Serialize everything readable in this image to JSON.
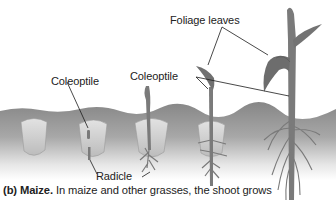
{
  "figure": {
    "labels": {
      "foliage_leaves": "Foliage leaves",
      "coleoptile_left": "Coleoptile",
      "coleoptile_right": "Coleoptile",
      "radicle": "Radicle"
    },
    "caption": {
      "prefix": "(b) Maize.",
      "text": " In maize and other grasses, the shoot grows"
    },
    "colors": {
      "soil_top": "#8a8a8a",
      "soil_bottom": "#ffffff",
      "seed": "#d6d6d6",
      "plant": "#7a7a7a",
      "leader_line": "#1a1a1a"
    },
    "stages": [
      "seed",
      "seed-with-coleoptile",
      "sprouting-seedling",
      "seedling",
      "young-plant"
    ]
  }
}
